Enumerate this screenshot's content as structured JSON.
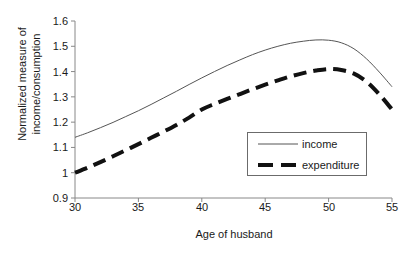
{
  "chart_data": {
    "type": "line",
    "title": "",
    "xlabel": "Age of husband",
    "ylabel": "Normalized measure of income/consumption",
    "ylabel_line1": "Normalized measure of",
    "ylabel_line2": "income/consumption",
    "xlim": [
      30,
      55
    ],
    "ylim": [
      0.9,
      1.6
    ],
    "xticks": [
      30,
      35,
      40,
      45,
      50,
      55
    ],
    "yticks": [
      "0.9",
      "1",
      "1.1",
      "1.2",
      "1.3",
      "1.4",
      "1.5",
      "1.6"
    ],
    "ytick_values": [
      0.9,
      1.0,
      1.1,
      1.2,
      1.3,
      1.4,
      1.5,
      1.6
    ],
    "grid": false,
    "legend_position": "lower-right-inside",
    "x": [
      30,
      31,
      32,
      33,
      34,
      35,
      36,
      37,
      38,
      39,
      40,
      41,
      42,
      43,
      44,
      45,
      46,
      47,
      48,
      49,
      50,
      51,
      52,
      53,
      54,
      55
    ],
    "series": [
      {
        "name": "income",
        "style": "solid",
        "color": "#555555",
        "width": 1,
        "values": [
          1.14,
          1.158,
          1.178,
          1.199,
          1.222,
          1.245,
          1.27,
          1.296,
          1.322,
          1.349,
          1.375,
          1.4,
          1.424,
          1.446,
          1.467,
          1.485,
          1.5,
          1.512,
          1.52,
          1.525,
          1.524,
          1.514,
          1.49,
          1.45,
          1.398,
          1.34
        ]
      },
      {
        "name": "expenditure",
        "style": "dashed",
        "color": "#111111",
        "width": 4,
        "values": [
          1.0,
          1.02,
          1.042,
          1.065,
          1.089,
          1.113,
          1.138,
          1.163,
          1.189,
          1.218,
          1.25,
          1.272,
          1.292,
          1.311,
          1.33,
          1.348,
          1.365,
          1.381,
          1.394,
          1.404,
          1.41,
          1.406,
          1.392,
          1.36,
          1.31,
          1.25
        ]
      }
    ],
    "axis_color": "#888888"
  }
}
